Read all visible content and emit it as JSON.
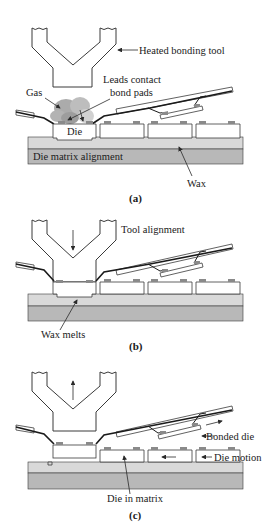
{
  "figure": {
    "panels": [
      {
        "id": "a",
        "caption": "(a)",
        "labels": {
          "tool": "Heated bonding tool",
          "leads": "Leads contact",
          "leads2": "bond pads",
          "gas": "Gas",
          "die": "Die",
          "matrix": "Die matrix alignment",
          "wax": "Wax"
        }
      },
      {
        "id": "b",
        "caption": "(b)",
        "labels": {
          "tool": "Tool alignment",
          "wax": "Wax melts"
        }
      },
      {
        "id": "c",
        "caption": "(c)",
        "labels": {
          "bonded": "Bonded die",
          "motion": "Die motion",
          "inmatrix": "Die in matrix"
        }
      }
    ],
    "colors": {
      "line": "#3a3a3a",
      "wax": "#d9d9d9",
      "matrix": "#b8b8b8",
      "pad": "#8a8a8a",
      "gas": "#9a9a9a"
    }
  }
}
